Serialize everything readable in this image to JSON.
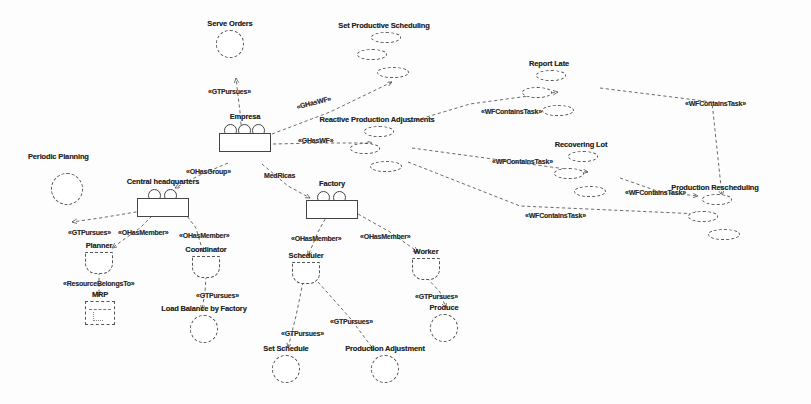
{
  "diagram": {
    "width": 811,
    "height": 404,
    "colors": {
      "background": "#fdfdfd",
      "stroke": "#555555",
      "text": "#232323"
    }
  },
  "nodes": [
    {
      "id": "serve_orders",
      "label": "Serve Orders",
      "type": "goal",
      "x": 210,
      "y": 22
    },
    {
      "id": "set_prod_scheduling",
      "label": "Set Productive Scheduling",
      "type": "workflow",
      "x": 383,
      "y": 24
    },
    {
      "id": "report_late",
      "label": "Report Late",
      "type": "workflow",
      "x": 548,
      "y": 62
    },
    {
      "id": "empresa",
      "label": "Empresa",
      "type": "organization",
      "x": 223,
      "y": 115
    },
    {
      "id": "reactive_prod_adj",
      "label": "Reactive Production Adjustments",
      "type": "workflow",
      "x": 374,
      "y": 118
    },
    {
      "id": "recovering_lot",
      "label": "Recovering Lot",
      "type": "workflow",
      "x": 578,
      "y": 143
    },
    {
      "id": "periodic_planning",
      "label": "Periodic Planning",
      "type": "goal",
      "x": 32,
      "y": 155
    },
    {
      "id": "central_headquarters",
      "label": "Central headquarters",
      "type": "organization",
      "x": 146,
      "y": 180
    },
    {
      "id": "production_resched",
      "label": "Production Rescheduling",
      "type": "workflow",
      "x": 700,
      "y": 186
    },
    {
      "id": "factory",
      "label": "Factory",
      "type": "organization",
      "x": 318,
      "y": 182
    },
    {
      "id": "planner",
      "label": "Planner",
      "type": "role",
      "x": 85,
      "y": 244
    },
    {
      "id": "coordinator",
      "label": "Coordinator",
      "type": "role",
      "x": 193,
      "y": 248
    },
    {
      "id": "scheduler",
      "label": "Scheduler",
      "type": "role",
      "x": 291,
      "y": 254
    },
    {
      "id": "worker",
      "label": "Worker",
      "type": "role",
      "x": 412,
      "y": 250
    },
    {
      "id": "mrp",
      "label": "MRP",
      "type": "resource",
      "x": 86,
      "y": 293
    },
    {
      "id": "load_balance",
      "label": "Load Balance by Factory",
      "type": "goal",
      "x": 170,
      "y": 307
    },
    {
      "id": "produce",
      "label": "Produce",
      "type": "goal",
      "x": 432,
      "y": 306
    },
    {
      "id": "set_schedule",
      "label": "Set Schedule",
      "type": "goal",
      "x": 262,
      "y": 347
    },
    {
      "id": "production_adjustment",
      "label": "Production Adjustment",
      "type": "goal",
      "x": 345,
      "y": 347
    }
  ],
  "edges": [
    {
      "id": "e1",
      "label": "«GTPursues»",
      "label_x": 208,
      "label_y": 88,
      "from": "empresa",
      "to": "serve_orders"
    },
    {
      "id": "e2",
      "label": "«GHasWF»",
      "label_x": 296,
      "label_y": 99,
      "from": "empresa",
      "to": "set_prod_scheduling"
    },
    {
      "id": "e3",
      "label": "«GHasWF»",
      "label_x": 298,
      "label_y": 137,
      "from": "empresa",
      "to": "reactive_prod_adj"
    },
    {
      "id": "e4",
      "label": "«OHasGroup»",
      "label_x": 186,
      "label_y": 168,
      "from": "empresa",
      "to": "central_headquarters"
    },
    {
      "id": "e5",
      "label": "MedRicas",
      "label_x": 264,
      "label_y": 172,
      "from": "empresa",
      "to": "factory"
    },
    {
      "id": "e6",
      "label": "«GTPursues»",
      "label_x": 68,
      "label_y": 229,
      "from": "central_headquarters",
      "to": "periodic_planning"
    },
    {
      "id": "e7",
      "label": "«OHasMember»",
      "label_x": 118,
      "label_y": 229,
      "from": "central_headquarters",
      "to": "planner"
    },
    {
      "id": "e8",
      "label": "«OHasMember»",
      "label_x": 179,
      "label_y": 232,
      "from": "central_headquarters",
      "to": "coordinator"
    },
    {
      "id": "e9",
      "label": "«OHasMember»",
      "label_x": 291,
      "label_y": 235,
      "from": "factory",
      "to": "scheduler"
    },
    {
      "id": "e10",
      "label": "«OHasMember»",
      "label_x": 360,
      "label_y": 233,
      "from": "factory",
      "to": "worker"
    },
    {
      "id": "e11",
      "label": "«ResourceBelongsTo»",
      "label_x": 63,
      "label_y": 280,
      "from": "planner",
      "to": "mrp"
    },
    {
      "id": "e12",
      "label": "«GTPursues»",
      "label_x": 196,
      "label_y": 292,
      "from": "coordinator",
      "to": "load_balance"
    },
    {
      "id": "e13",
      "label": "«GTPursues»",
      "label_x": 281,
      "label_y": 330,
      "from": "scheduler",
      "to": "set_schedule"
    },
    {
      "id": "e14",
      "label": "«GTPursues»",
      "label_x": 330,
      "label_y": 318,
      "from": "scheduler",
      "to": "production_adjustment"
    },
    {
      "id": "e15",
      "label": "«GTPursues»",
      "label_x": 415,
      "label_y": 293,
      "from": "worker",
      "to": "produce"
    },
    {
      "id": "e16",
      "label": "«WFContainsTask»",
      "label_x": 481,
      "label_y": 108,
      "from": "reactive_prod_adj",
      "to": "report_late"
    },
    {
      "id": "e17",
      "label": "«WFContainsTask»",
      "label_x": 492,
      "label_y": 158,
      "from": "reactive_prod_adj",
      "to": "recovering_lot"
    },
    {
      "id": "e18",
      "label": "«WFContainsTask»",
      "label_x": 525,
      "label_y": 212,
      "from": "reactive_prod_adj",
      "to": "production_resched"
    },
    {
      "id": "e19",
      "label": "«WFContainsTask»",
      "label_x": 685,
      "label_y": 100,
      "from": "report_late",
      "to": "production_resched"
    },
    {
      "id": "e20",
      "label": "«WFContainsTask»",
      "label_x": 625,
      "label_y": 189,
      "from": "recovering_lot",
      "to": "production_resched"
    }
  ]
}
